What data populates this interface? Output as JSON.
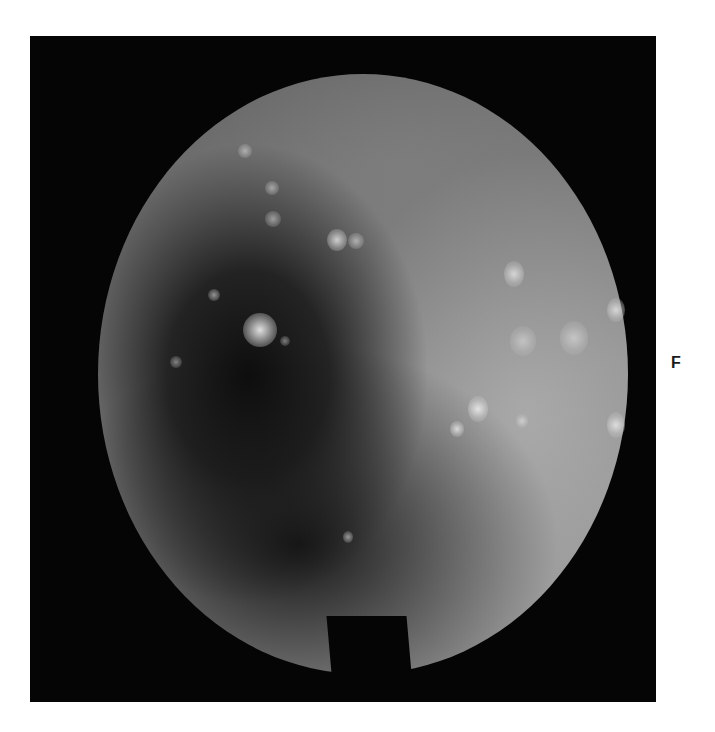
{
  "figure": {
    "panel_label": "F",
    "colors": {
      "background": "#ffffff",
      "frame": "#050505",
      "tissue_mid": "#8e8e8e",
      "lumen_dark": "#141414",
      "highlight": "#ebebeb"
    }
  }
}
